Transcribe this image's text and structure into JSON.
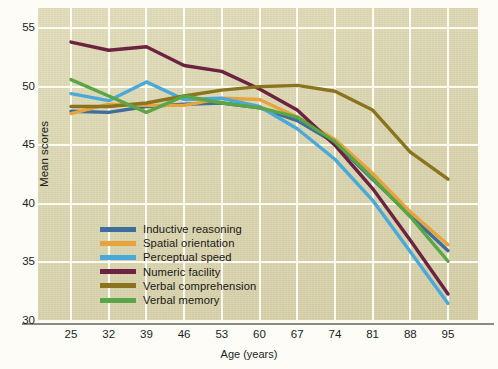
{
  "chart_data": {
    "type": "line",
    "title": "",
    "xlabel": "Age (years)",
    "ylabel": "Mean scores",
    "x": [
      25,
      32,
      39,
      46,
      53,
      60,
      67,
      74,
      81,
      88,
      95
    ],
    "xticklabels": [
      "25",
      "32",
      "39",
      "46",
      "53",
      "60",
      "67",
      "74",
      "81",
      "88",
      "95"
    ],
    "yticklabels": [
      "30",
      "35",
      "40",
      "45",
      "50",
      "55"
    ],
    "xlim": [
      25,
      95
    ],
    "ylim": [
      30,
      55
    ],
    "grid": true,
    "legend_position": "lower left inside axes",
    "series": [
      {
        "name": "Inductive reasoning",
        "color": "#3d6e9c",
        "values": [
          47.9,
          47.8,
          48.3,
          48.5,
          48.6,
          48.2,
          47.1,
          45.2,
          42.1,
          39.0,
          36.0
        ]
      },
      {
        "name": "Spatial orientation",
        "color": "#e9a33c",
        "values": [
          47.7,
          48.5,
          48.4,
          48.4,
          49.0,
          48.9,
          47.4,
          45.5,
          42.6,
          39.3,
          36.5
        ]
      },
      {
        "name": "Perceptual speed",
        "color": "#4aa9d9",
        "values": [
          49.4,
          48.8,
          50.4,
          48.9,
          49.0,
          48.3,
          46.4,
          43.8,
          40.3,
          35.9,
          31.5
        ]
      },
      {
        "name": "Numeric facility",
        "color": "#6c2241",
        "values": [
          53.8,
          53.1,
          53.4,
          51.8,
          51.3,
          49.8,
          48.0,
          45.0,
          41.3,
          36.9,
          32.3
        ]
      },
      {
        "name": "Verbal comprehension",
        "color": "#8b7420",
        "values": [
          48.3,
          48.3,
          48.6,
          49.2,
          49.7,
          50.0,
          50.1,
          49.6,
          48.0,
          44.4,
          42.1
        ]
      },
      {
        "name": "Verbal memory",
        "color": "#5aa545",
        "values": [
          50.6,
          49.2,
          47.8,
          49.2,
          48.6,
          48.2,
          47.4,
          45.3,
          42.2,
          38.9,
          35.1
        ]
      }
    ]
  },
  "colors": {
    "panel_background": "#ded9b4",
    "gridline": "#fdfdf6",
    "axis_line": "#8d8a7e",
    "text": "#201e1b",
    "figure_background": "#fdfcf7"
  }
}
